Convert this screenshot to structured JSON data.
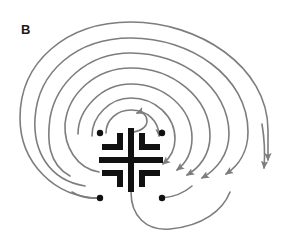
{
  "figure": {
    "panel_label": "B",
    "diagram_type": "labyrinth-seed-pattern",
    "background_color": "#ffffff",
    "seed_color": "#111111",
    "arc_color": "#7d7d7d",
    "label_color": "#1a1a1a",
    "arc_stroke_width": 1.6,
    "seed_stroke_width": 6,
    "dot_radius": 3.2,
    "center": {
      "x": 131,
      "y": 160
    },
    "seed_pattern": {
      "cross": {
        "name": "central-cross",
        "vertical_x": 131,
        "vertical_y1": 128,
        "vertical_y2": 192,
        "horizontal_y": 160,
        "horizontal_x1": 99,
        "horizontal_x2": 163
      },
      "corners": [
        {
          "name": "corner-upper-left",
          "hx1": 102,
          "hx2": 120,
          "hy": 147,
          "vx": 120,
          "vy1": 147,
          "vy2": 133
        },
        {
          "name": "corner-upper-right",
          "hx1": 142,
          "hx2": 160,
          "hy": 147,
          "vx": 142,
          "vy1": 147,
          "vy2": 133
        },
        {
          "name": "corner-lower-left",
          "hx1": 102,
          "hx2": 120,
          "hy": 173,
          "vx": 120,
          "vy1": 173,
          "vy2": 187
        },
        {
          "name": "corner-lower-right",
          "hx1": 142,
          "hx2": 160,
          "hy": 173,
          "vx": 142,
          "vy1": 173,
          "vy2": 187
        }
      ],
      "dots": [
        {
          "name": "dot-upper-left",
          "x": 100,
          "y": 133
        },
        {
          "name": "dot-upper-right",
          "x": 162,
          "y": 133
        },
        {
          "name": "dot-lower-left",
          "x": 100,
          "y": 198
        },
        {
          "name": "dot-lower-right",
          "x": 162,
          "y": 198
        }
      ]
    },
    "arcs": [
      {
        "name": "arc-1-innermost",
        "radius": 14,
        "start_angle": 200,
        "sweep": 250,
        "arrow": "clockwise-top-right"
      },
      {
        "name": "arc-2",
        "radius": 27,
        "start_angle": 186,
        "sweep": 250,
        "arrow": "clockwise-right"
      },
      {
        "name": "arc-3",
        "radius": 40,
        "start_angle": 180,
        "sweep": 250,
        "arrow": "clockwise-right"
      },
      {
        "name": "arc-4",
        "radius": 53,
        "start_angle": 178,
        "sweep": 250,
        "arrow": "clockwise-right"
      },
      {
        "name": "arc-5",
        "radius": 66,
        "start_angle": 176,
        "sweep": 250,
        "arrow": "clockwise-right"
      },
      {
        "name": "arc-6",
        "radius": 80,
        "start_angle": 175,
        "sweep": 250,
        "arrow": "clockwise-right"
      },
      {
        "name": "arc-7",
        "radius": 94,
        "start_angle": 174,
        "sweep": 250,
        "arrow": "clockwise-right"
      },
      {
        "name": "arc-8-outermost",
        "radius": 108,
        "start_angle": 173,
        "sweep": 250,
        "arrow": "clockwise-right"
      },
      {
        "name": "arc-bottom-entry",
        "radius": 40,
        "start_angle": 90,
        "sweep": 120,
        "arrow": "none"
      }
    ],
    "arrow_count": 11,
    "arrow_marker": "filled-triangle"
  }
}
